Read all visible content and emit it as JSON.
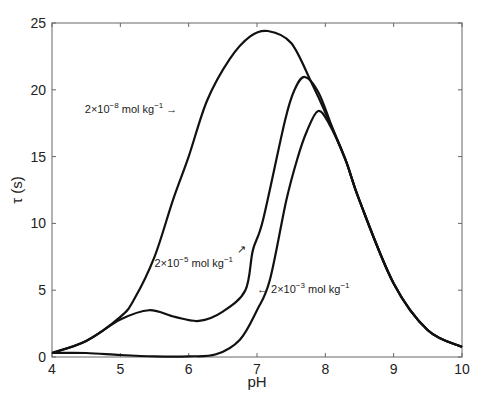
{
  "chart_data": {
    "type": "line",
    "title": "",
    "xlabel": "pH",
    "ylabel": "τ (s)",
    "xlim": [
      4,
      10
    ],
    "ylim": [
      0,
      25
    ],
    "xticks": [
      4,
      5,
      6,
      7,
      8,
      9,
      10
    ],
    "yticks": [
      0,
      5,
      10,
      15,
      20,
      25
    ],
    "grid": false,
    "legend": "none (inline annotations)",
    "series": [
      {
        "name": "2×10^-8 mol kg^-1",
        "x": [
          4.0,
          4.5,
          5.0,
          5.2,
          5.5,
          5.77,
          6.0,
          6.27,
          6.6,
          6.9,
          7.16,
          7.5,
          7.8,
          8.0,
          8.3,
          8.5,
          9.0,
          9.5,
          10.0
        ],
        "y": [
          0.3,
          1.2,
          3.0,
          4.3,
          7.5,
          11.75,
          15.0,
          19.2,
          22.3,
          24.0,
          24.4,
          23.5,
          20.5,
          18.3,
          14.7,
          11.7,
          5.5,
          2.0,
          0.75
        ]
      },
      {
        "name": "2×10^-5 mol kg^-1",
        "x": [
          4.0,
          4.5,
          5.0,
          5.42,
          5.8,
          6.15,
          6.5,
          6.83,
          6.94,
          7.09,
          7.41,
          7.55,
          7.7,
          7.9,
          8.1,
          8.3,
          8.5,
          9.0,
          9.5,
          10.0
        ],
        "y": [
          0.3,
          1.2,
          2.8,
          3.5,
          3.0,
          2.7,
          3.4,
          5.0,
          8.0,
          10.3,
          17.7,
          20.0,
          20.96,
          19.8,
          17.2,
          14.7,
          11.7,
          5.5,
          2.0,
          0.75
        ]
      },
      {
        "name": "2×10^-3 mol kg^-1",
        "x": [
          4.0,
          4.5,
          5.0,
          5.5,
          6.0,
          6.4,
          6.75,
          7.0,
          7.19,
          7.43,
          7.6,
          7.73,
          7.89,
          8.05,
          8.3,
          8.5,
          9.0,
          9.5,
          10.0
        ],
        "y": [
          0.3,
          0.3,
          0.15,
          0.05,
          0.05,
          0.2,
          1.3,
          3.5,
          5.8,
          11.75,
          15.0,
          16.9,
          18.4,
          17.5,
          14.7,
          11.7,
          5.5,
          2.0,
          0.75
        ]
      }
    ],
    "annotations": [
      {
        "text": "2×10^-8 mol kg^-1 →",
        "base": "2×10",
        "exp": "−8",
        "unit": " mol kg",
        "unit_exp": "−1",
        "prefix": "",
        "suffix": " →",
        "x": 4.48,
        "y": 18.3
      },
      {
        "text": "2×10^-5 mol kg^-1 ↗",
        "base": "2×10",
        "exp": "−5",
        "unit": " mol kg",
        "unit_exp": "−1",
        "prefix": "",
        "suffix": "",
        "arrow": "↗",
        "x": 5.5,
        "y": 6.7
      },
      {
        "text": "← 2×10^-3 mol kg^-1",
        "base": "2×10",
        "exp": "−3",
        "unit": " mol kg",
        "unit_exp": "−1",
        "prefix": "← ",
        "suffix": "",
        "x": 7.0,
        "y": 4.8
      }
    ]
  },
  "plot_area": {
    "left": 52,
    "top": 23,
    "right": 462,
    "bottom": 357
  },
  "colors": {
    "line": "#111111",
    "axis": "#666666",
    "text": "#222222"
  }
}
